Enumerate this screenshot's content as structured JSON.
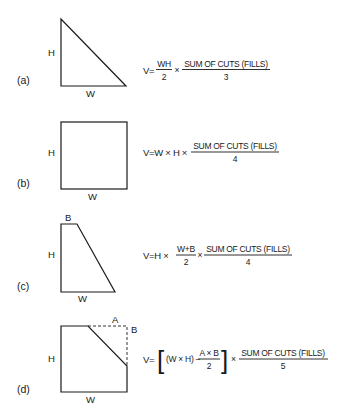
{
  "figures": [
    {
      "id": "a",
      "part_label": "(a)",
      "shape": "right-triangle",
      "dimension_labels": {
        "height": "H",
        "width": "W"
      },
      "formula": {
        "lhs": "V=",
        "first_fraction": {
          "numerator": "WH",
          "denominator": "2"
        },
        "times": "×",
        "main_fraction": {
          "numerator": "SUM OF CUTS (FILLS)",
          "denominator": "3"
        }
      }
    },
    {
      "id": "b",
      "part_label": "(b)",
      "shape": "rectangle",
      "dimension_labels": {
        "height": "H",
        "width": "W"
      },
      "formula": {
        "prefix": "V=W × H ×",
        "main_fraction": {
          "numerator": "SUM OF CUTS (FILLS)",
          "denominator": "4"
        }
      }
    },
    {
      "id": "c",
      "part_label": "(c)",
      "shape": "trapezoid",
      "dimension_labels": {
        "height": "H",
        "width": "W",
        "top": "B"
      },
      "formula": {
        "prefix": "V=H ×",
        "first_fraction": {
          "numerator": "W+B",
          "denominator": "2"
        },
        "times": "×",
        "main_fraction": {
          "numerator": "SUM OF CUTS (FILLS)",
          "denominator": "4"
        }
      }
    },
    {
      "id": "d",
      "part_label": "(d)",
      "shape": "rectangle-with-corner-cut",
      "dimension_labels": {
        "height": "H",
        "width": "W",
        "cut_horizontal": "A",
        "cut_vertical": "B"
      },
      "formula": {
        "lhs": "V=",
        "left_bracket": "[",
        "inner": "(W × H) −",
        "first_fraction": {
          "numerator": "A × B",
          "denominator": "2"
        },
        "right_bracket": "]",
        "times": "×",
        "main_fraction": {
          "numerator": "SUM OF CUTS (FILLS)",
          "denominator": "5"
        }
      }
    }
  ]
}
